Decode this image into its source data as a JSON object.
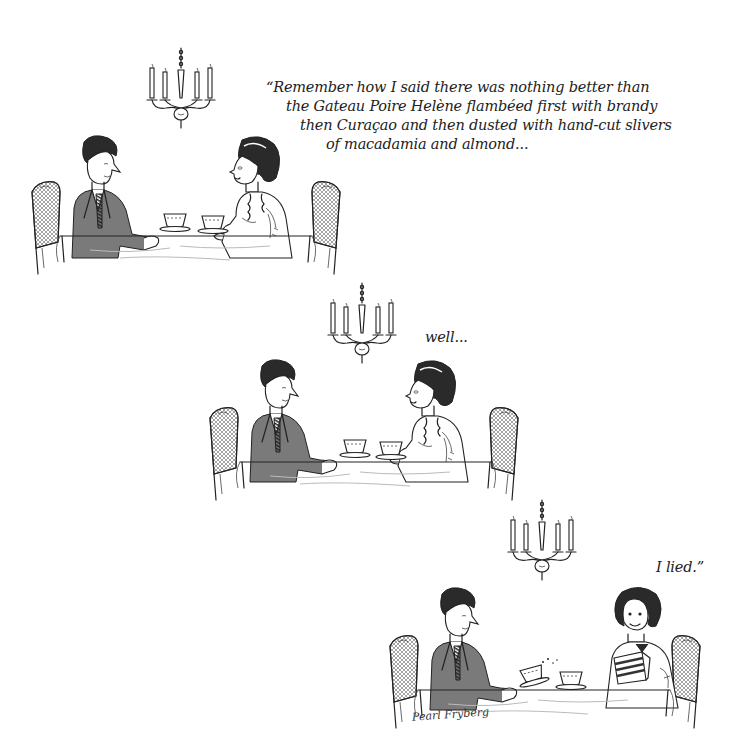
{
  "comic": {
    "panels": [
      {
        "id": 1,
        "caption_lines": [
          "“Remember how I said there was nothing better than",
          "the Gateau Poire Helène flambéed first with brandy",
          "then Curaçao and then dusted with hand-cut slivers",
          "of macadamia and almond..."
        ],
        "scene": "man and woman seated at table with teacups under candle chandelier; woman speaking"
      },
      {
        "id": 2,
        "caption_lines": [
          "well..."
        ],
        "scene": "same couple at table; woman pausing"
      },
      {
        "id": 3,
        "caption_lines": [
          "I lied.”"
        ],
        "scene": "woman smiling holding a slice of layered cake; man looking surprised, spilling tea"
      }
    ],
    "signature": "Pearl Fryberg",
    "icons": {
      "chandelier": "chandelier-icon",
      "chair": "cane-chair-icon",
      "teacup": "teacup-icon",
      "cake": "cake-slice-icon"
    }
  }
}
